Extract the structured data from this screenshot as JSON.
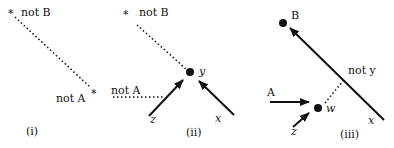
{
  "panels": [
    {
      "id": "i",
      "caption": "(i)",
      "labels": {
        "not_b": "not B",
        "not_a": "not A"
      }
    },
    {
      "id": "ii",
      "caption": "(ii)",
      "labels": {
        "not_b": "not B",
        "not_a": "not A",
        "y": "y",
        "z": "z",
        "x": "x"
      }
    },
    {
      "id": "iii",
      "caption": "(iii)",
      "labels": {
        "b": "B",
        "not_y": "not y",
        "a": "A",
        "w": "w",
        "z": "z",
        "x": "x"
      }
    }
  ],
  "symbols": {
    "star": "*"
  },
  "colors": {
    "ink": "#111111",
    "background": "#ffffff"
  }
}
